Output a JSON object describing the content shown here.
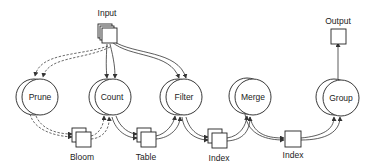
{
  "diagram": {
    "type": "dataflow-pipeline",
    "colors": {
      "stroke": "#222222",
      "background": "#ffffff"
    },
    "io": {
      "input": {
        "label": "Input",
        "shape": "stacked-box"
      },
      "output": {
        "label": "Output",
        "shape": "box"
      }
    },
    "operators": [
      {
        "id": "prune",
        "label": "Prune"
      },
      {
        "id": "count",
        "label": "Count"
      },
      {
        "id": "filter",
        "label": "Filter"
      },
      {
        "id": "merge",
        "label": "Merge"
      },
      {
        "id": "group",
        "label": "Group"
      }
    ],
    "states": [
      {
        "id": "bloom",
        "label": "Bloom",
        "shape": "stacked-box"
      },
      {
        "id": "table",
        "label": "Table",
        "shape": "stacked-box"
      },
      {
        "id": "index1",
        "label": "Index",
        "shape": "stacked-box"
      },
      {
        "id": "index2",
        "label": "Index",
        "shape": "box"
      }
    ],
    "edges": [
      {
        "from": "input",
        "to": "prune",
        "style": "dashed"
      },
      {
        "from": "input",
        "to": "count",
        "style": "solid"
      },
      {
        "from": "input",
        "to": "filter",
        "style": "solid"
      },
      {
        "from": "prune",
        "to": "bloom",
        "style": "dashed"
      },
      {
        "from": "bloom",
        "to": "count",
        "style": "dashed"
      },
      {
        "from": "count",
        "to": "table",
        "style": "solid"
      },
      {
        "from": "table",
        "to": "filter",
        "style": "solid"
      },
      {
        "from": "filter",
        "to": "index1",
        "style": "solid"
      },
      {
        "from": "index1",
        "to": "merge",
        "style": "solid"
      },
      {
        "from": "merge",
        "to": "index2",
        "style": "solid"
      },
      {
        "from": "index2",
        "to": "group",
        "style": "solid"
      },
      {
        "from": "group",
        "to": "output",
        "style": "solid"
      }
    ]
  }
}
